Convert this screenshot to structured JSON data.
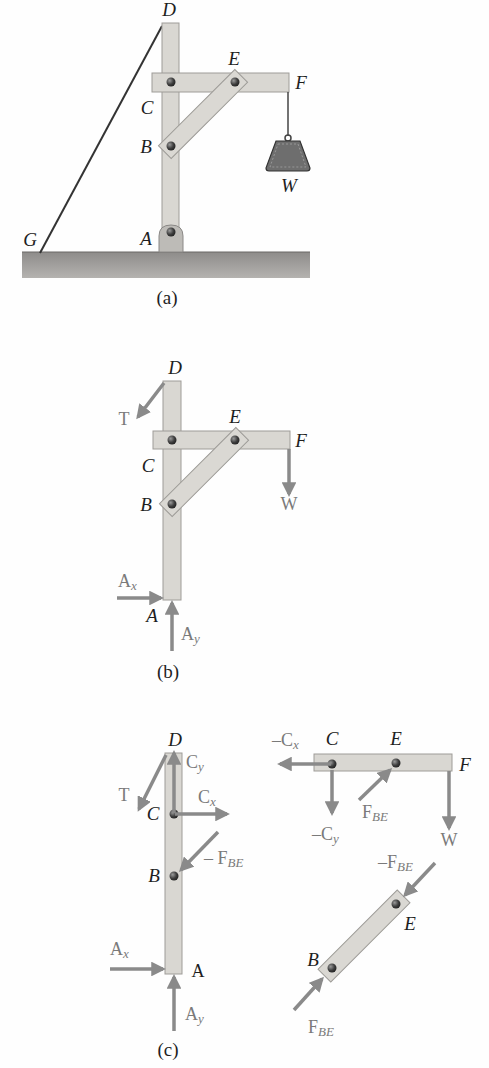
{
  "figure": {
    "parts": [
      {
        "id": "a",
        "caption": "(a)",
        "labels": {
          "D": "D",
          "E": "E",
          "F": "F",
          "C": "C",
          "B": "B",
          "W": "W",
          "G": "G",
          "A": "A"
        }
      },
      {
        "id": "b",
        "caption": "(b)",
        "labels": {
          "D": "D",
          "E": "E",
          "F": "F",
          "C": "C",
          "B": "B",
          "A": "A"
        },
        "forces": {
          "T": "T",
          "W": "W",
          "Ax": "A",
          "Ax_sub": "x",
          "Ay": "A",
          "Ay_sub": "y"
        }
      },
      {
        "id": "c",
        "caption": "(c)",
        "labels": {
          "D": "D",
          "C": "C",
          "B": "B",
          "A": "A",
          "C2": "C",
          "E2": "E",
          "F2": "F",
          "E3": "E",
          "B3": "B"
        },
        "forces": {
          "T": "T",
          "Cy": "C",
          "Cy_sub": "y",
          "Cx": "C",
          "Cx_sub": "x",
          "negFBE": "– F",
          "negFBE_sub": "BE",
          "Ax": "A",
          "Ax_sub": "x",
          "Ay": "A",
          "Ay_sub": "y",
          "negCx": "–C",
          "negCx_sub": "x",
          "negCy": "–C",
          "negCy_sub": "y",
          "FBE": "F",
          "FBE_sub": "BE",
          "W": "W",
          "negFBE2": "–F",
          "negFBE2_sub": "BE",
          "FBE2": "F",
          "FBE2_sub": "BE"
        }
      }
    ],
    "colors": {
      "wood": "#d9d7d2",
      "wood_edge": "#9e9c98",
      "arrow": "#8a8a8a",
      "pin": "#4a4a4a",
      "ground": "#9a9896",
      "weight": "#6e6e6e"
    }
  }
}
